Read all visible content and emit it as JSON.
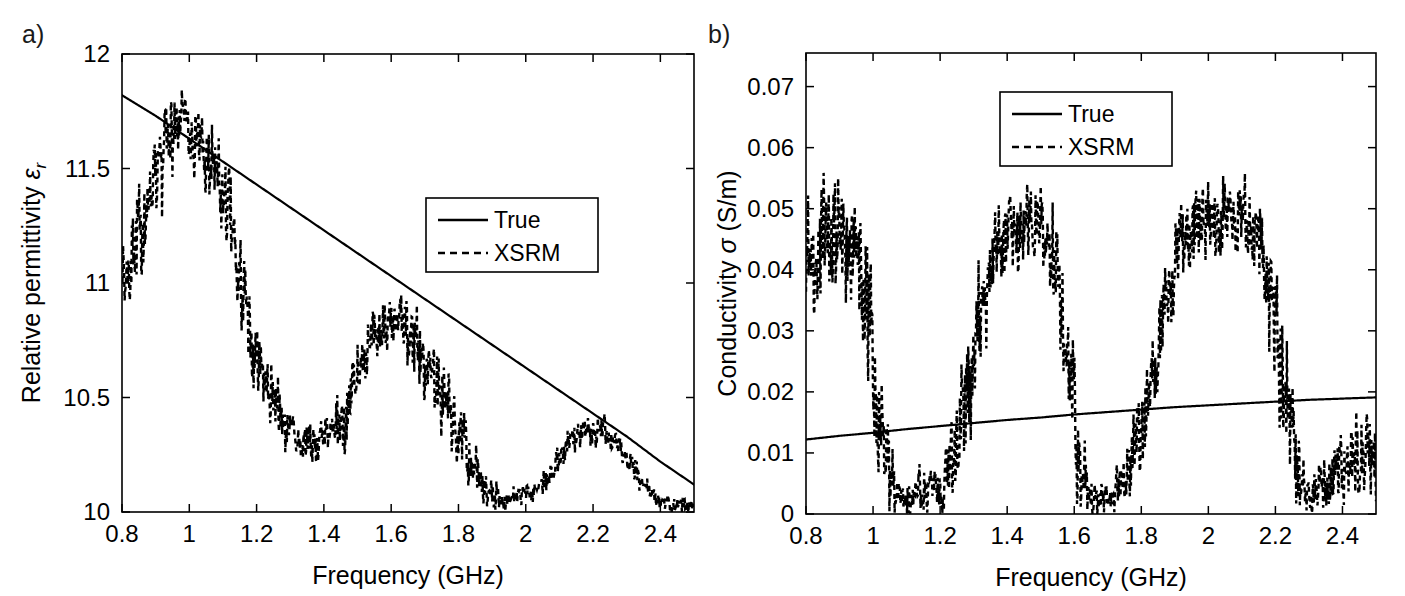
{
  "figure": {
    "background": "#ffffff",
    "line_color": "#000000",
    "panels": [
      "a)",
      "b)"
    ]
  },
  "panel_a": {
    "label": "a)",
    "legend_entries": [
      {
        "label": "True",
        "style": "solid"
      },
      {
        "label": "XSRM",
        "style": "dashed"
      }
    ]
  },
  "panel_b": {
    "label": "b)",
    "legend_entries": [
      {
        "label": "True",
        "style": "solid"
      },
      {
        "label": "XSRM",
        "style": "dashed"
      }
    ]
  },
  "chart_data": [
    {
      "id": "panel-a",
      "type": "line",
      "title": "",
      "xlabel": "Frequency (GHz)",
      "ylabel": "Relative permittivity εr",
      "ylabel_main": "Relative permittivity ",
      "ylabel_symbol": "ε",
      "ylabel_sub": "r",
      "xlim": [
        0.8,
        2.5
      ],
      "ylim": [
        10,
        12
      ],
      "xticks": [
        0.8,
        1,
        1.2,
        1.4,
        1.6,
        1.8,
        2,
        2.2,
        2.4
      ],
      "xticklabels": [
        "0.8",
        "1",
        "1.2",
        "1.4",
        "1.6",
        "1.8",
        "2",
        "2.2",
        "2.4"
      ],
      "yticks": [
        10,
        10.5,
        11,
        11.5,
        12
      ],
      "yticklabels": [
        "10",
        "10.5",
        "11",
        "11.5",
        "12"
      ],
      "grid": false,
      "legend_position": "center-right",
      "series": [
        {
          "name": "True",
          "style": "solid",
          "x": [
            0.8,
            0.9,
            1.0,
            1.1,
            1.2,
            1.3,
            1.4,
            1.5,
            1.6,
            1.7,
            1.8,
            1.9,
            2.0,
            2.1,
            2.2,
            2.3,
            2.4,
            2.5
          ],
          "y": [
            11.82,
            11.73,
            11.63,
            11.53,
            11.43,
            11.33,
            11.23,
            11.13,
            11.03,
            10.93,
            10.83,
            10.73,
            10.63,
            10.53,
            10.43,
            10.33,
            10.22,
            10.12
          ]
        },
        {
          "name": "XSRM",
          "style": "dashed",
          "description": "Noisy oscillatory reconstruction band fluctuating about the True curve",
          "x": [
            0.8,
            0.83,
            0.86,
            0.89,
            0.92,
            0.95,
            0.98,
            1.01,
            1.04,
            1.07,
            1.1,
            1.13,
            1.16,
            1.19,
            1.22,
            1.25,
            1.28,
            1.31,
            1.34,
            1.37,
            1.4,
            1.43,
            1.46,
            1.49,
            1.52,
            1.55,
            1.58,
            1.61,
            1.64,
            1.67,
            1.7,
            1.73,
            1.76,
            1.79,
            1.82,
            1.85,
            1.88,
            1.91,
            1.94,
            1.97,
            2.0,
            2.03,
            2.06,
            2.09,
            2.12,
            2.15,
            2.18,
            2.21,
            2.24,
            2.27,
            2.3,
            2.33,
            2.36,
            2.39,
            2.42,
            2.45
          ],
          "y_center": [
            11.02,
            11.12,
            11.25,
            11.4,
            11.55,
            11.66,
            11.7,
            11.66,
            11.58,
            11.48,
            11.4,
            11.2,
            10.92,
            10.72,
            10.6,
            10.5,
            10.4,
            10.33,
            10.29,
            10.3,
            10.33,
            10.35,
            10.4,
            10.55,
            10.7,
            10.76,
            10.8,
            10.82,
            10.8,
            10.75,
            10.66,
            10.58,
            10.48,
            10.38,
            10.28,
            10.18,
            10.1,
            10.06,
            10.05,
            10.07,
            10.08,
            10.1,
            10.14,
            10.2,
            10.28,
            10.33,
            10.36,
            10.36,
            10.34,
            10.3,
            10.24,
            10.16,
            10.1,
            10.06,
            10.04,
            10.03
          ],
          "band_half_width": [
            0.16,
            0.16,
            0.17,
            0.17,
            0.16,
            0.14,
            0.13,
            0.13,
            0.14,
            0.15,
            0.16,
            0.17,
            0.16,
            0.14,
            0.12,
            0.1,
            0.09,
            0.08,
            0.08,
            0.08,
            0.09,
            0.1,
            0.11,
            0.12,
            0.11,
            0.1,
            0.1,
            0.11,
            0.12,
            0.12,
            0.12,
            0.12,
            0.12,
            0.11,
            0.1,
            0.08,
            0.06,
            0.05,
            0.04,
            0.04,
            0.04,
            0.04,
            0.05,
            0.05,
            0.06,
            0.06,
            0.06,
            0.06,
            0.05,
            0.05,
            0.04,
            0.04,
            0.03,
            0.03,
            0.03,
            0.03
          ]
        }
      ]
    },
    {
      "id": "panel-b",
      "type": "line",
      "title": "",
      "xlabel": "Frequency (GHz)",
      "ylabel": "Conductivity σ (S/m)",
      "ylabel_main": "Conductivity ",
      "ylabel_symbol": "σ",
      "ylabel_tail": " (S/m)",
      "xlim": [
        0.8,
        2.5
      ],
      "ylim": [
        0,
        0.0755
      ],
      "xticks": [
        0.8,
        1,
        1.2,
        1.4,
        1.6,
        1.8,
        2,
        2.2,
        2.4
      ],
      "xticklabels": [
        "0.8",
        "1",
        "1.2",
        "1.4",
        "1.6",
        "1.8",
        "2",
        "2.2",
        "2.4"
      ],
      "yticks": [
        0,
        0.01,
        0.02,
        0.03,
        0.04,
        0.05,
        0.06,
        0.07
      ],
      "yticklabels": [
        "0",
        "0.01",
        "0.02",
        "0.03",
        "0.04",
        "0.05",
        "0.06",
        "0.07"
      ],
      "grid": false,
      "legend_position": "top-center",
      "series": [
        {
          "name": "True",
          "style": "solid",
          "x": [
            0.8,
            0.9,
            1.0,
            1.1,
            1.2,
            1.3,
            1.4,
            1.5,
            1.6,
            1.7,
            1.8,
            1.9,
            2.0,
            2.1,
            2.2,
            2.3,
            2.4,
            2.5
          ],
          "y": [
            0.0122,
            0.0128,
            0.0133,
            0.0139,
            0.0144,
            0.0149,
            0.0154,
            0.0158,
            0.0163,
            0.0167,
            0.0171,
            0.0175,
            0.0178,
            0.0181,
            0.0184,
            0.0187,
            0.0189,
            0.0191
          ]
        },
        {
          "name": "XSRM",
          "style": "dashed",
          "description": "Noisy oscillatory reconstruction with three broad lobes peaking near 0.9, 1.45 and 2.1 GHz and clipping at zero in between",
          "x": [
            0.8,
            0.83,
            0.86,
            0.89,
            0.92,
            0.95,
            0.98,
            1.01,
            1.04,
            1.07,
            1.1,
            1.13,
            1.16,
            1.19,
            1.22,
            1.25,
            1.28,
            1.31,
            1.34,
            1.37,
            1.4,
            1.43,
            1.46,
            1.49,
            1.52,
            1.55,
            1.58,
            1.61,
            1.64,
            1.67,
            1.7,
            1.73,
            1.76,
            1.79,
            1.82,
            1.85,
            1.88,
            1.91,
            1.94,
            1.97,
            2.0,
            2.03,
            2.06,
            2.09,
            2.12,
            2.15,
            2.18,
            2.21,
            2.24,
            2.27,
            2.3,
            2.33,
            2.36,
            2.39,
            2.42,
            2.45
          ],
          "y_center": [
            0.04,
            0.0425,
            0.0455,
            0.047,
            0.0455,
            0.042,
            0.035,
            0.02,
            0.008,
            0.003,
            0.002,
            0.0035,
            0.004,
            0.0045,
            0.006,
            0.011,
            0.019,
            0.029,
            0.038,
            0.043,
            0.0455,
            0.047,
            0.0475,
            0.047,
            0.045,
            0.038,
            0.025,
            0.011,
            0.004,
            0.002,
            0.0025,
            0.004,
            0.007,
            0.012,
            0.019,
            0.028,
            0.037,
            0.043,
            0.046,
            0.0475,
            0.048,
            0.0485,
            0.049,
            0.049,
            0.048,
            0.044,
            0.037,
            0.027,
            0.016,
            0.007,
            0.003,
            0.0035,
            0.0055,
            0.0075,
            0.009,
            0.01
          ],
          "band_half_width": [
            0.0075,
            0.008,
            0.0085,
            0.0082,
            0.008,
            0.0075,
            0.009,
            0.01,
            0.007,
            0.003,
            0.002,
            0.003,
            0.003,
            0.0035,
            0.0045,
            0.006,
            0.007,
            0.007,
            0.0065,
            0.006,
            0.0055,
            0.0055,
            0.0055,
            0.0055,
            0.006,
            0.0075,
            0.0085,
            0.007,
            0.0035,
            0.002,
            0.002,
            0.003,
            0.004,
            0.0055,
            0.0065,
            0.007,
            0.0065,
            0.006,
            0.0055,
            0.0055,
            0.0055,
            0.005,
            0.005,
            0.005,
            0.0055,
            0.006,
            0.007,
            0.008,
            0.0075,
            0.005,
            0.0025,
            0.003,
            0.004,
            0.005,
            0.0055,
            0.006
          ]
        }
      ]
    }
  ]
}
